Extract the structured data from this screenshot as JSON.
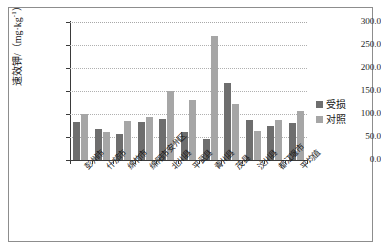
{
  "chart_data": {
    "type": "bar",
    "title": "",
    "xlabel": "",
    "ylabel": "速效钾/（mg·kg-1）",
    "ylabel_main": "速效钾/（mg·kg",
    "ylabel_sup": "-1",
    "ylabel_tail": "）",
    "ylim": [
      0,
      300
    ],
    "ytick_step": 50,
    "ytick_labels": [
      "300.0",
      "250.0",
      "200.0",
      "150.0",
      "100.0",
      "50.0",
      "0.0"
    ],
    "ytick_values": [
      300,
      250,
      200,
      150,
      100,
      50,
      0
    ],
    "grid": true,
    "legend_position": "right",
    "categories": [
      "彭州市",
      "什邡市",
      "绵竹市",
      "绵阳市安州区",
      "北川县",
      "平武县",
      "青川县",
      "茂县",
      "汶川县",
      "都江堰市",
      "平均值"
    ],
    "series": [
      {
        "name": "受损",
        "color": "#6e6e6e",
        "values": [
          82,
          67,
          57,
          82,
          90,
          60,
          45,
          168,
          87,
          73,
          80
        ]
      },
      {
        "name": "对照",
        "color": "#a6a6a6",
        "values": [
          100,
          60,
          85,
          93,
          150,
          130,
          269,
          122,
          63,
          86,
          106
        ]
      }
    ]
  },
  "legend": {
    "items": [
      {
        "label": "受损",
        "swatch": "damaged"
      },
      {
        "label": "对照",
        "swatch": "control"
      }
    ]
  },
  "colors": {
    "damaged": "#6e6e6e",
    "control": "#a6a6a6",
    "axis": "#3a3a3a",
    "grid": "#b0b0b0",
    "frame": "#8d8d8d",
    "background": "#ffffff"
  }
}
